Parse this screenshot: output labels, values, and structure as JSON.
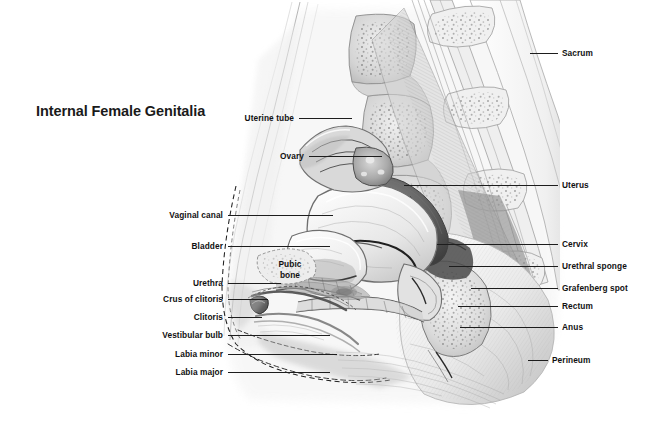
{
  "figure": {
    "title": "Internal Female Genitalia",
    "type": "anatomical-illustration",
    "view": "mid-sagittal section of the female pelvis",
    "style": "grayscale pencil rendering",
    "background_color": "#ffffff",
    "line_color": "#1d1d1d",
    "text_color": "#111111"
  },
  "labels_left": [
    {
      "name": "uterine-tube",
      "text": "Uterine tube",
      "text_x": 294,
      "text_y": 118,
      "leader_x1": 299,
      "leader_x2": 352,
      "leader_y": 118
    },
    {
      "name": "ovary",
      "text": "Ovary",
      "text_x": 304,
      "text_y": 156,
      "leader_x1": 309,
      "leader_x2": 382,
      "leader_y": 156
    },
    {
      "name": "vaginal-canal",
      "text": "Vaginal canal",
      "text_x": 223,
      "text_y": 215,
      "leader_x1": 228,
      "leader_x2": 333,
      "leader_y": 215
    },
    {
      "name": "bladder",
      "text": "Bladder",
      "text_x": 223,
      "text_y": 246,
      "leader_x1": 228,
      "leader_x2": 330,
      "leader_y": 246
    },
    {
      "name": "urethra",
      "text": "Urethra",
      "text_x": 223,
      "text_y": 283,
      "leader_x1": 228,
      "leader_x2": 281,
      "leader_y": 283
    },
    {
      "name": "crus-of-clitoris",
      "text": "Crus of clitoris",
      "text_x": 223,
      "text_y": 299,
      "leader_x1": 228,
      "leader_x2": 268,
      "leader_y": 299
    },
    {
      "name": "clitoris",
      "text": "Clitoris",
      "text_x": 223,
      "text_y": 317,
      "leader_x1": 228,
      "leader_x2": 262,
      "leader_y": 317
    },
    {
      "name": "vestibular-bulb",
      "text": "Vestibular bulb",
      "text_x": 223,
      "text_y": 335,
      "leader_x1": 228,
      "leader_x2": 330,
      "leader_y": 335
    },
    {
      "name": "labia-minor",
      "text": "Labia minor",
      "text_x": 223,
      "text_y": 354,
      "leader_x1": 228,
      "leader_x2": 337,
      "leader_y": 354
    },
    {
      "name": "labia-major",
      "text": "Labia major",
      "text_x": 223,
      "text_y": 372,
      "leader_x1": 228,
      "leader_x2": 330,
      "leader_y": 372
    }
  ],
  "labels_right": [
    {
      "name": "sacrum",
      "text": "Sacrum",
      "text_x": 562,
      "text_y": 53,
      "leader_x1": 530,
      "leader_x2": 558,
      "leader_y": 53
    },
    {
      "name": "uterus",
      "text": "Uterus",
      "text_x": 562,
      "text_y": 185,
      "leader_x1": 404,
      "leader_x2": 558,
      "leader_y": 185
    },
    {
      "name": "cervix",
      "text": "Cervix",
      "text_x": 562,
      "text_y": 244,
      "leader_x1": 437,
      "leader_x2": 558,
      "leader_y": 244
    },
    {
      "name": "urethral-sponge",
      "text": "Urethral sponge",
      "text_x": 562,
      "text_y": 266,
      "leader_x1": 449,
      "leader_x2": 558,
      "leader_y": 266
    },
    {
      "name": "grafenberg-spot",
      "text": "Grafenberg spot",
      "text_x": 562,
      "text_y": 288,
      "leader_x1": 471,
      "leader_x2": 558,
      "leader_y": 288
    },
    {
      "name": "rectum",
      "text": "Rectum",
      "text_x": 562,
      "text_y": 306,
      "leader_x1": 458,
      "leader_x2": 558,
      "leader_y": 306
    },
    {
      "name": "anus",
      "text": "Anus",
      "text_x": 562,
      "text_y": 327,
      "leader_x1": 460,
      "leader_x2": 558,
      "leader_y": 327
    },
    {
      "name": "perineum",
      "text": "Perineum",
      "text_x": 552,
      "text_y": 360,
      "leader_x1": 528,
      "leader_x2": 548,
      "leader_y": 360
    }
  ],
  "labels_inline": [
    {
      "name": "pubic-bone",
      "line1": "Pubic",
      "line2": "bone",
      "text_x": 290,
      "text_y": 270
    }
  ],
  "structures": [
    "sacrum",
    "lumbar vertebrae",
    "uterus",
    "uterine tube",
    "ovary",
    "cervix",
    "vaginal canal",
    "bladder",
    "urethra",
    "urethral sponge",
    "Grafenberg spot",
    "pubic bone",
    "crus of clitoris",
    "clitoris",
    "vestibular bulb",
    "labia minor",
    "labia major",
    "rectum",
    "anus",
    "perineum",
    "abdominal wall",
    "buttock"
  ]
}
